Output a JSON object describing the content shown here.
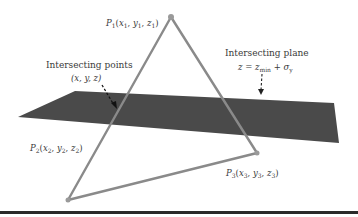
{
  "diagram": {
    "colors": {
      "plane": "#4a4a4a",
      "triangle": "#8a8a8a",
      "vertex": "#9a9a9a",
      "arrow": "#222222",
      "text": "#3a3a3a",
      "rule": "#2a2a2a"
    },
    "vertices": {
      "p1": {
        "label": "P",
        "index": "1",
        "coords": [
          "x",
          "y",
          "z"
        ],
        "sub": "1",
        "pos": [
          171,
          17
        ]
      },
      "p2": {
        "label": "P",
        "index": "2",
        "coords": [
          "x",
          "y",
          "z"
        ],
        "sub": "2",
        "pos": [
          68,
          200
        ]
      },
      "p3": {
        "label": "P",
        "index": "3",
        "coords": [
          "x",
          "y",
          "z"
        ],
        "sub": "3",
        "pos": [
          257,
          153
        ]
      }
    },
    "plane": {
      "title": "Intersecting plane",
      "equation_lhs": "z",
      "equation_eq": "=",
      "equation_term": "z",
      "equation_term_sub": "min",
      "equation_plus": "+",
      "equation_sigma": "σ",
      "equation_sigma_sub": "y"
    },
    "points": {
      "title": "Intersecting points",
      "coords": "(x, y, z)"
    }
  }
}
